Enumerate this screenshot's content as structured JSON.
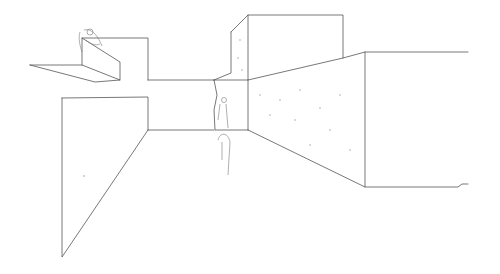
{
  "title": "",
  "sketch": {
    "stroke_color": "#555555",
    "background": "#ffffff",
    "stipple_color": "#9a9a9a"
  }
}
